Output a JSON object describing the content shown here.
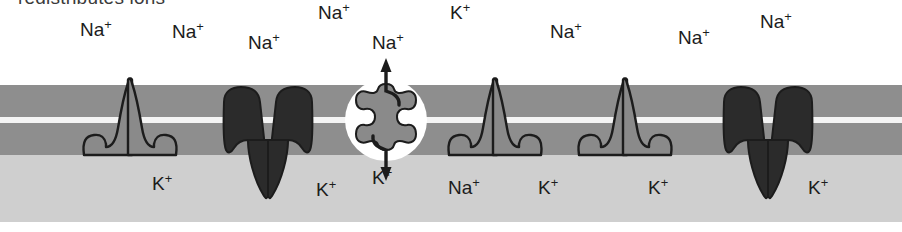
{
  "figure": {
    "caption": "redistributes ions",
    "colors": {
      "background": "#ffffff",
      "membrane_leaflet": "#8e8e8e",
      "membrane_midline": "#f4f4f4",
      "cytoplasm": "#cfcfcf",
      "channel_light": "#8a8a8a",
      "channel_dark": "#2b2b2b",
      "pore_ring": "#ffffff",
      "pore_core": "#8a8a8a",
      "outline": "#1c1c1c",
      "label_text": "#1c1c1c"
    }
  },
  "membrane": {
    "outer_leaflet_label": "outer-leaflet",
    "midline_label": "membrane-midline",
    "inner_leaflet_label": "inner-leaflet",
    "cytoplasm_label": "cytoplasm"
  },
  "ions": {
    "extracellular": [
      {
        "name": "sodium",
        "symbol": "Na",
        "charge": "+",
        "x": 80,
        "y": 20
      },
      {
        "name": "sodium",
        "symbol": "Na",
        "charge": "+",
        "x": 172,
        "y": 22
      },
      {
        "name": "sodium",
        "symbol": "Na",
        "charge": "+",
        "x": 248,
        "y": 33
      },
      {
        "name": "sodium",
        "symbol": "Na",
        "charge": "+",
        "x": 318,
        "y": 3
      },
      {
        "name": "sodium",
        "symbol": "Na",
        "charge": "+",
        "x": 372,
        "y": 33
      },
      {
        "name": "potassium",
        "symbol": "K",
        "charge": "+",
        "x": 450,
        "y": 3
      },
      {
        "name": "sodium",
        "symbol": "Na",
        "charge": "+",
        "x": 550,
        "y": 22
      },
      {
        "name": "sodium",
        "symbol": "Na",
        "charge": "+",
        "x": 678,
        "y": 28
      },
      {
        "name": "sodium",
        "symbol": "Na",
        "charge": "+",
        "x": 760,
        "y": 12
      }
    ],
    "intracellular": [
      {
        "name": "potassium",
        "symbol": "K",
        "charge": "+",
        "x": 152,
        "y": 174
      },
      {
        "name": "potassium",
        "symbol": "K",
        "charge": "+",
        "x": 316,
        "y": 180
      },
      {
        "name": "potassium",
        "symbol": "K",
        "charge": "+",
        "x": 372,
        "y": 168
      },
      {
        "name": "potassium",
        "symbol": "K",
        "charge": "+",
        "x": 440,
        "y": 178
      },
      {
        "name": "sodium",
        "symbol": "Na",
        "charge": "+",
        "x": 448,
        "y": 178
      },
      {
        "name": "potassium",
        "symbol": "K",
        "charge": "+",
        "x": 538,
        "y": 178
      },
      {
        "name": "potassium",
        "symbol": "K",
        "charge": "+",
        "x": 648,
        "y": 178
      },
      {
        "name": "potassium",
        "symbol": "K",
        "charge": "+",
        "x": 808,
        "y": 178
      }
    ]
  },
  "channels": [
    {
      "id": 1,
      "type": "light-channel",
      "orientation": "up",
      "cx": 130
    },
    {
      "id": 2,
      "type": "dark-channel",
      "orientation": "down",
      "cx": 268
    },
    {
      "id": 3,
      "type": "pore",
      "orientation": "none",
      "cx": 386
    },
    {
      "id": 4,
      "type": "light-channel",
      "orientation": "up",
      "cx": 495
    },
    {
      "id": 5,
      "type": "light-channel",
      "orientation": "up",
      "cx": 625
    },
    {
      "id": 6,
      "type": "dark-channel",
      "orientation": "down",
      "cx": 768
    }
  ],
  "pore": {
    "name": "transmembrane-pore",
    "influx": {
      "label": "Na",
      "charge": "+",
      "direction": "up"
    },
    "efflux": {
      "label": "K",
      "charge": "+",
      "direction": "down"
    }
  }
}
